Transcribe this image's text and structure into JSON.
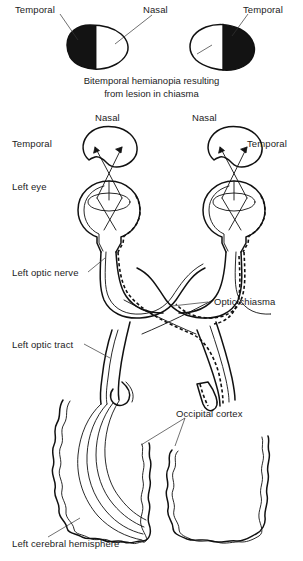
{
  "figure": {
    "ink_color": "#111111",
    "background_color": "#ffffff",
    "defect_fill_color": "#131313"
  },
  "top_panel": {
    "name": "visual-field-defect-panel",
    "labels": {
      "left_temporal": "Temporal",
      "nasal": "Nasal",
      "right_temporal": "Temporal"
    },
    "fields": [
      {
        "side": "left-visual-field",
        "blind_half": "left",
        "blind_half_meaning": "temporal",
        "seeing_half": "right"
      },
      {
        "side": "right-visual-field",
        "blind_half": "right",
        "blind_half_meaning": "temporal",
        "seeing_half": "left"
      }
    ],
    "caption_line1": "Bitemporal hemianopia resulting",
    "caption_line2": "from lesion in chiasma"
  },
  "pathway_panel": {
    "name": "visual-pathway-panel",
    "labels": {
      "nasal_left": "Nasal",
      "nasal_right": "Nasal",
      "temporal_left": "Temporal",
      "temporal_right": "Temporal",
      "left_eye": "Left eye",
      "left_optic_nerve": "Left optic nerve",
      "optic_chiasma": "Optic chiasma",
      "left_optic_tract": "Left optic tract",
      "occipital_cortex": "Occipital cortex",
      "left_cerebral_hemisphere": "Left cerebral hemisphere"
    },
    "structures": [
      {
        "name": "left-visual-field-outline",
        "type": "field-blob"
      },
      {
        "name": "right-visual-field-outline",
        "type": "field-blob"
      },
      {
        "name": "left-eyeball",
        "type": "eye"
      },
      {
        "name": "right-eyeball",
        "type": "eye"
      },
      {
        "name": "optic-chiasma",
        "type": "chiasma"
      },
      {
        "name": "left-cerebral-hemisphere",
        "type": "hemisphere"
      },
      {
        "name": "right-cerebral-hemisphere",
        "type": "hemisphere"
      }
    ]
  }
}
